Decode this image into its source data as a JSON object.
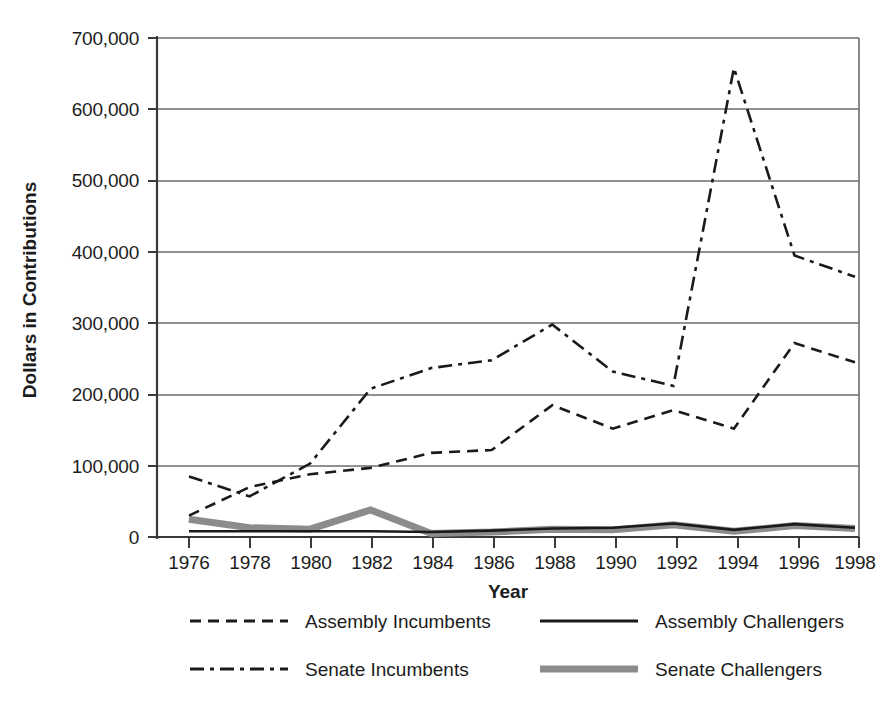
{
  "chart_data": {
    "type": "line",
    "title": "",
    "xlabel": "Year",
    "ylabel": "Dollars in Contributions",
    "categories": [
      1976,
      1978,
      1980,
      1982,
      1984,
      1986,
      1988,
      1990,
      1992,
      1994,
      1996,
      1998
    ],
    "x": [
      "1976",
      "1978",
      "1980",
      "1982",
      "1984",
      "1986",
      "1988",
      "1990",
      "1992",
      "1994",
      "1996",
      "1998"
    ],
    "xlim": [
      1976,
      1998
    ],
    "ylim": [
      0,
      700000
    ],
    "ytick_values": [
      0,
      100000,
      200000,
      300000,
      400000,
      500000,
      600000,
      700000
    ],
    "ytick_labels": [
      "0",
      "100,000",
      "200,000",
      "300,000",
      "400,000",
      "500,000",
      "600,000",
      "700,000"
    ],
    "xtick_labels": [
      "1976",
      "1978",
      "1980",
      "1982",
      "1984",
      "1986",
      "1988",
      "1990",
      "1992",
      "1994",
      "1996",
      "1998"
    ],
    "grid": true,
    "grid_axis": "y",
    "legend_position": "bottom",
    "legend_columns": 2,
    "series": [
      {
        "name": "Assembly Incumbents",
        "style": "dashed",
        "color": "#1a1a1a",
        "width": 2.6,
        "dash": "11,7",
        "values": [
          30000,
          70000,
          88000,
          97000,
          118000,
          122000,
          185000,
          152000,
          178000,
          152000,
          272000,
          245000
        ]
      },
      {
        "name": "Senate Incumbents",
        "style": "dash-dot",
        "color": "#1a1a1a",
        "width": 2.6,
        "dash": "14,6,4,6",
        "values": [
          85000,
          57000,
          103000,
          208000,
          237000,
          248000,
          298000,
          232000,
          212000,
          658000,
          395000,
          365000
        ]
      },
      {
        "name": "Assembly Challengers",
        "style": "solid",
        "color": "#1a1a1a",
        "width": 2.6,
        "dash": "none",
        "values": [
          8000,
          8000,
          8000,
          8000,
          7000,
          9000,
          12000,
          13000,
          19000,
          10000,
          18000,
          13000
        ]
      },
      {
        "name": "Senate Challengers",
        "style": "solid-thick",
        "color": "#8c8c8c",
        "width": 7,
        "dash": "none",
        "values": [
          25000,
          13000,
          11000,
          38000,
          5000,
          7000,
          11000,
          10000,
          17000,
          8000,
          16000,
          12000
        ]
      }
    ]
  },
  "axes": {
    "y_title": "Dollars in Contributions",
    "x_title": "Year"
  },
  "legend": {
    "entries": [
      {
        "label": "Assembly Incumbents",
        "swatch": "dashed-line-swatch"
      },
      {
        "label": "Assembly Challengers",
        "swatch": "solid-line-swatch"
      },
      {
        "label": "Senate Incumbents",
        "swatch": "dash-dot-line-swatch"
      },
      {
        "label": "Senate Challengers",
        "swatch": "thick-gray-line-swatch"
      }
    ]
  },
  "colors": {
    "ink": "#1a1a1a",
    "grid": "#6d6d6d",
    "gray_series": "#8c8c8c",
    "background": "#ffffff"
  }
}
